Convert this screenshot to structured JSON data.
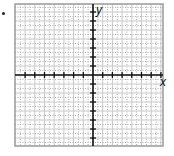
{
  "bullet": {
    "x": 3,
    "y": 13
  },
  "graph": {
    "frame": {
      "left": 15,
      "top": 4,
      "right": 163,
      "bottom": 146
    },
    "origin": {
      "x": 93,
      "y": 75
    },
    "unit_x": 9.7,
    "unit_y": 9.0,
    "x_range": [
      -8,
      7
    ],
    "y_range": [
      -8,
      7
    ],
    "x_ticks_left": 7,
    "x_ticks_right": 7,
    "y_ticks_up": 7,
    "y_ticks_down": 7,
    "colors": {
      "axis": "#111111",
      "grid_solid": "#c8c8c8",
      "grid_dotted": "#b0b0b0",
      "frame": "#9a9a9a"
    }
  },
  "labels": {
    "x_axis": "x",
    "y_axis": "y"
  }
}
